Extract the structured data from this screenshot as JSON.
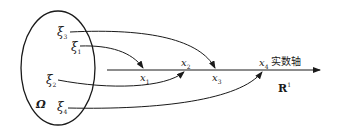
{
  "diagram": {
    "sample_space": {
      "symbol": "Ω",
      "outcomes": [
        {
          "symbol": "ξ",
          "sub": "3",
          "maps_to": "x3"
        },
        {
          "symbol": "ξ",
          "sub": "1",
          "maps_to": "x1"
        },
        {
          "symbol": "ξ",
          "sub": "2",
          "maps_to": "x2"
        },
        {
          "symbol": "ξ",
          "sub": "4",
          "maps_to": "x4"
        }
      ]
    },
    "axis": {
      "name": "实数轴",
      "space": "R",
      "space_sup": "1",
      "points": [
        {
          "symbol": "x",
          "sub": "1"
        },
        {
          "symbol": "x",
          "sub": "2"
        },
        {
          "symbol": "x",
          "sub": "3"
        },
        {
          "symbol": "x",
          "sub": "4"
        }
      ]
    },
    "colors": {
      "stroke": "#1a1a1a",
      "background": "#ffffff"
    }
  }
}
